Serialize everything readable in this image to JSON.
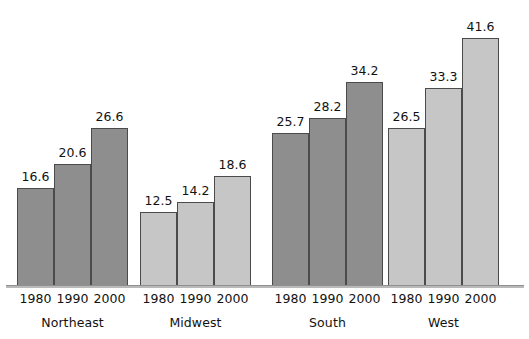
{
  "chart_data": {
    "type": "bar",
    "title": "",
    "subtitle": "",
    "xlabel": "",
    "ylabel": "",
    "grid": false,
    "legend": "none",
    "axis_visible": {
      "x_baseline": true,
      "y_axis": false,
      "y_ticks": false
    },
    "categories": [
      "1980",
      "1990",
      "2000"
    ],
    "groups": [
      {
        "name": "Northeast",
        "shade": "dark",
        "bars": [
          {
            "year": "1980",
            "value": 16.6,
            "label": "16.6"
          },
          {
            "year": "1990",
            "value": 20.6,
            "label": "20.6"
          },
          {
            "year": "2000",
            "value": 26.6,
            "label": "26.6"
          }
        ]
      },
      {
        "name": "Midwest",
        "shade": "light",
        "bars": [
          {
            "year": "1980",
            "value": 12.5,
            "label": "12.5"
          },
          {
            "year": "1990",
            "value": 14.2,
            "label": "14.2"
          },
          {
            "year": "2000",
            "value": 18.6,
            "label": "18.6"
          }
        ]
      },
      {
        "name": "South",
        "shade": "dark",
        "bars": [
          {
            "year": "1980",
            "value": 25.7,
            "label": "25.7"
          },
          {
            "year": "1990",
            "value": 28.2,
            "label": "28.2"
          },
          {
            "year": "2000",
            "value": 34.2,
            "label": "34.2"
          }
        ]
      },
      {
        "name": "West",
        "shade": "light",
        "bars": [
          {
            "year": "1980",
            "value": 26.5,
            "label": "26.5"
          },
          {
            "year": "1990",
            "value": 33.3,
            "label": "33.3"
          },
          {
            "year": "2000",
            "value": 41.6,
            "label": "41.6"
          }
        ]
      }
    ],
    "ylim": [
      0,
      41.6
    ],
    "value_label_position": "above-bar"
  },
  "colors": {
    "dark_bar": "#8e8e8e",
    "light_bar": "#c6c6c6",
    "bar_outline": "#4b4b4b",
    "baseline": "#b9b9b9",
    "text": "#121212",
    "background": "#ffffff"
  },
  "layout": {
    "bar_width": 37,
    "group_gap": 12,
    "plot_bottom_y": 285,
    "px_per_unit": 5.99,
    "group_left_positions": [
      17,
      140,
      272,
      388
    ]
  }
}
